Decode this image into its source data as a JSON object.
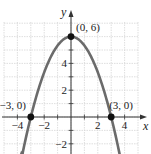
{
  "chart_data": {
    "type": "line",
    "title": "",
    "xlabel": "x",
    "ylabel": "y",
    "function": "y = -2/3 x^2 + 6",
    "xlim": [
      -5,
      5
    ],
    "ylim": [
      -2.5,
      7
    ],
    "grid": true,
    "x_ticks": [
      -4,
      -2,
      2,
      4
    ],
    "y_ticks": [
      -2,
      2,
      4
    ],
    "x_tick_labels": [
      "−4",
      "−2",
      "2",
      "4"
    ],
    "y_tick_labels": [
      "−2",
      "2",
      "4"
    ],
    "series": [
      {
        "name": "parabola",
        "color": "#6b6b6b",
        "x": [
          -3.6,
          -3,
          -2,
          -1,
          0,
          1,
          2,
          3,
          3.6
        ],
        "y": [
          -2.64,
          0,
          3.33,
          5.33,
          6,
          5.33,
          3.33,
          0,
          -2.64
        ]
      }
    ],
    "points": [
      {
        "x": -3,
        "y": 0,
        "label": "(−3, 0)"
      },
      {
        "x": 0,
        "y": 6,
        "label": "(0, 6)"
      },
      {
        "x": 3,
        "y": 0,
        "label": "(3, 0)"
      }
    ],
    "annotations": [
      "(−3, 0)",
      "(0, 6)",
      "(3, 0)"
    ]
  },
  "colors": {
    "curve": "#6b6b6b",
    "axis": "#333333",
    "grid": "#d6d6d6",
    "point": "#111111"
  }
}
